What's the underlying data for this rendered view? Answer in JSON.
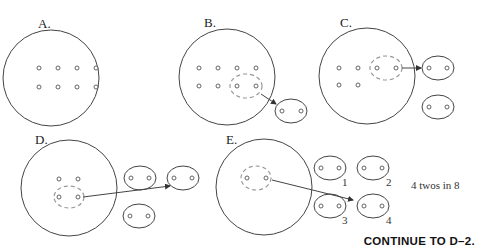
{
  "panels": [
    {
      "id": "A",
      "label": "A."
    },
    {
      "id": "B",
      "label": "B."
    },
    {
      "id": "C",
      "label": "C."
    },
    {
      "id": "D",
      "label": "D."
    },
    {
      "id": "E",
      "label": "E."
    }
  ],
  "groups_numbered": [
    "1",
    "2",
    "3",
    "4"
  ],
  "note": "4 twos in 8",
  "footer": {
    "continue_label": "CONTINUE TO D–2."
  },
  "colors": {
    "stroke": "#444444",
    "dashed": "#999999",
    "text": "#222222"
  }
}
